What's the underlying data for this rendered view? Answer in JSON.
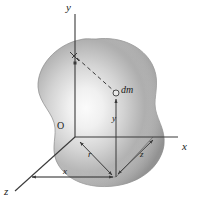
{
  "figure": {
    "type": "physics-diagram",
    "background_color": "#ffffff",
    "body": {
      "name": "irregular-rigid-body-blob",
      "fill_dark": "#9a9a9a",
      "fill_mid": "#bdbdbd",
      "fill_light": "#f2f2f2",
      "outline_color": "#8f8f8f"
    },
    "axes": [
      {
        "id": "y-axis",
        "label": "y",
        "label_x": 66,
        "label_y": 4,
        "direction": "up"
      },
      {
        "id": "x-axis",
        "label": "x",
        "label_x": 182,
        "label_y": 147,
        "direction": "right"
      },
      {
        "id": "z-axis",
        "label": "z",
        "label_x": 5,
        "label_y": 190,
        "direction": "down-left"
      }
    ],
    "annotations": [
      {
        "id": "origin",
        "label": "O",
        "x": 57,
        "y": 126,
        "style": "upright"
      },
      {
        "id": "mass-element",
        "label": "dm",
        "x": 120,
        "y": 88,
        "style": "italic"
      },
      {
        "id": "y-coordinate",
        "label": "y",
        "x": 113,
        "y": 119,
        "style": "italic"
      },
      {
        "id": "radial-distance",
        "label": "r",
        "x": 87,
        "y": 155,
        "style": "italic"
      },
      {
        "id": "z-coordinate",
        "label": "z",
        "x": 140,
        "y": 155,
        "style": "italic"
      },
      {
        "id": "x-coordinate",
        "label": "x",
        "x": 62,
        "y": 171,
        "style": "italic"
      }
    ],
    "geometry": {
      "origin": [
        75,
        137
      ],
      "dm_point": [
        116,
        93
      ],
      "foot_point": [
        116,
        177
      ],
      "y_axis_top": [
        75,
        14
      ],
      "x_axis_end": [
        178,
        137
      ],
      "z_axis_end": [
        14,
        192
      ],
      "perp_marker": [
        76,
        57
      ]
    },
    "line_styles": {
      "solid_color": "#3a3a3a",
      "dashed_color": "#3a3a3a",
      "dash_pattern": "4 3"
    }
  }
}
